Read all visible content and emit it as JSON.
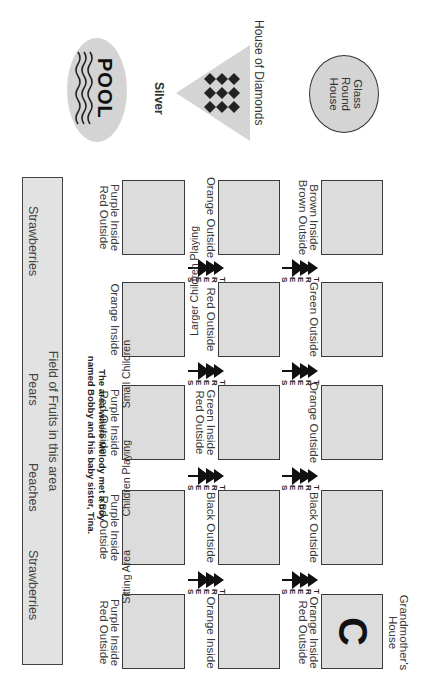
{
  "map": {
    "landmarks": {
      "glass_round_house": {
        "line1": "Glass",
        "line2": "Round",
        "line3": "House"
      },
      "house_of_diamonds": {
        "label": "House of Diamonds",
        "sublabel": "Silver"
      },
      "pool": {
        "label": "POOL"
      },
      "grandmothers_house": {
        "line1": "Grandmother's",
        "line2": "House",
        "letter": "C"
      }
    },
    "row_top": [
      {
        "line1": "Brown Inside",
        "line2": "Brown Outside"
      },
      {
        "line1": "Green Outside",
        "line2": ""
      },
      {
        "line1": "Orange Outside",
        "line2": ""
      },
      {
        "line1": "Black Outside",
        "line2": ""
      },
      {
        "line1": "Orange Inside",
        "line2": "Red Outside"
      }
    ],
    "row_middle": [
      {
        "line1": "Orange Outside",
        "line2": ""
      },
      {
        "line1": "Red Outside",
        "line2": ""
      },
      {
        "line1": "Green Inside",
        "line2": "Red Outside"
      },
      {
        "line1": "Black Outside",
        "line2": ""
      },
      {
        "line1": "Orange Inside",
        "line2": ""
      }
    ],
    "row_bottom": [
      {
        "line1": "Purple Inside",
        "line2": "Red Outside"
      },
      {
        "line1": "Orange Inside",
        "line2": ""
      },
      {
        "line1": "Purple Inside",
        "line2": "Red Outside"
      },
      {
        "line1": "Purple Inside",
        "line2": "Red Outside"
      },
      {
        "line1": "Purple Inside",
        "line2": "Red Outside"
      }
    ],
    "trees_label": "TREES",
    "area_labels": [
      "Larger Children Playing",
      "Small Children",
      "Children Playing",
      "Sitting Area"
    ],
    "note": {
      "line1": "The area where Melody met a boy",
      "line2": "named Bobby and his baby sister, Tina."
    },
    "field": {
      "title": "Field of Fruits in this area",
      "fruits": [
        "Strawberries",
        "Pears",
        "Peaches",
        "Strawberries"
      ]
    },
    "colors": {
      "lot_fill": "#dcdcdc",
      "lot_border": "#3a3a3a",
      "landmark_fill": "#d4d4d4",
      "ink": "#222222"
    }
  }
}
